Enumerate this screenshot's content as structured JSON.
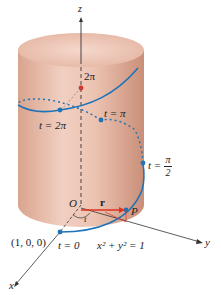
{
  "diagram": {
    "axes": {
      "z": "z",
      "y": "y",
      "x": "x"
    },
    "labels": {
      "z_height": "2π",
      "t_2pi": "t = 2π",
      "t_pi": "t = π",
      "t_pi_over_2_prefix": "t =",
      "t_pi_over_2_num": "π",
      "t_pi_over_2_den": "2",
      "t_0": "t = 0",
      "point_1_0_0": "(1, 0, 0)",
      "origin": "O",
      "vector_r": "r",
      "point_P": "P",
      "angle_t": "t",
      "cylinder_equation": "x² + y² = 1"
    },
    "colors": {
      "cylinder": "#e8b9a6",
      "cylinder_dark": "#c98f78",
      "helix": "#1f73b7",
      "vector": "#e0321e",
      "axis": "#333333",
      "point_red": "#d8302a"
    }
  }
}
